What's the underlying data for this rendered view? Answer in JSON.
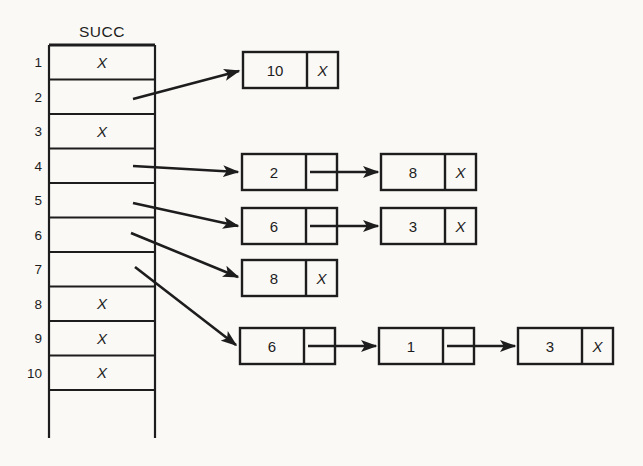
{
  "diagram_title": "SUCC array with successor linked lists",
  "colors": {
    "background": "#faf9f6",
    "line": "#1d1d1d"
  },
  "array": {
    "title": "SUCC",
    "null_symbol": "X",
    "rows": [
      {
        "index": "1",
        "value": "X"
      },
      {
        "index": "2",
        "value": "",
        "points_to": "list-2"
      },
      {
        "index": "3",
        "value": "X"
      },
      {
        "index": "4",
        "value": "",
        "points_to": "list-4"
      },
      {
        "index": "5",
        "value": "",
        "points_to": "list-5"
      },
      {
        "index": "6",
        "value": "",
        "points_to": "list-6"
      },
      {
        "index": "7",
        "value": "",
        "points_to": "list-7"
      },
      {
        "index": "8",
        "value": "X"
      },
      {
        "index": "9",
        "value": "X"
      },
      {
        "index": "10",
        "value": "X"
      }
    ]
  },
  "lists": [
    {
      "id": "list-2",
      "source_row": "2",
      "nodes": [
        {
          "value": "10",
          "next": "X"
        }
      ]
    },
    {
      "id": "list-4",
      "source_row": "4",
      "nodes": [
        {
          "value": "2",
          "next": "pointer"
        },
        {
          "value": "8",
          "next": "X"
        }
      ]
    },
    {
      "id": "list-5",
      "source_row": "5",
      "nodes": [
        {
          "value": "6",
          "next": "pointer"
        },
        {
          "value": "3",
          "next": "X"
        }
      ]
    },
    {
      "id": "list-6",
      "source_row": "6",
      "nodes": [
        {
          "value": "8",
          "next": "X"
        }
      ]
    },
    {
      "id": "list-7",
      "source_row": "7",
      "nodes": [
        {
          "value": "6",
          "next": "pointer"
        },
        {
          "value": "1",
          "next": "pointer"
        },
        {
          "value": "3",
          "next": "X"
        }
      ]
    }
  ]
}
